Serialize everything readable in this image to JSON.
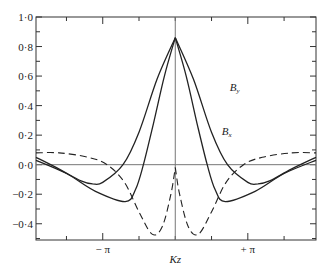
{
  "chart_data": {
    "type": "line",
    "title": "",
    "xlabel": "Kz",
    "ylabel": "",
    "xlim_in_pi": [
      -1.92,
      1.94
    ],
    "ylim": [
      -0.51,
      1.0
    ],
    "grid": false,
    "legend": "inline labels near curves",
    "y_ticks": [
      1.0,
      0.8,
      0.6,
      0.4,
      0.2,
      0.0,
      -0.2,
      -0.4
    ],
    "y_tick_labels": [
      "1·0",
      "0·8",
      "0·6",
      "0·4",
      "0·2",
      "0·0",
      "−0·2",
      "−0·4"
    ],
    "x_tick_labels": [
      {
        "at_pi": -1,
        "label": "− π"
      },
      {
        "at_pi": 1,
        "label": "+ π"
      }
    ],
    "horizontal_reference": 0.0,
    "vertical_reference_at_pi": 0.0,
    "series": [
      {
        "name": "By",
        "label_main": "B",
        "label_sub": "y",
        "style": "solid",
        "x_in_pi": [
          -1.92,
          -1.6,
          -1.3,
          -1.14,
          -1.0,
          -0.72,
          -0.5,
          -0.25,
          0.0,
          0.25,
          0.5,
          0.72,
          1.0,
          1.14,
          1.3,
          1.6,
          1.94
        ],
        "y": [
          0.05,
          -0.03,
          -0.11,
          -0.13,
          -0.12,
          0.0,
          0.22,
          0.58,
          0.86,
          0.58,
          0.22,
          0.0,
          -0.12,
          -0.13,
          -0.11,
          -0.03,
          0.05
        ]
      },
      {
        "name": "Bx",
        "label_main": "B",
        "label_sub": "x",
        "style": "solid",
        "x_in_pi": [
          -1.92,
          -1.5,
          -1.1,
          -0.69,
          -0.55,
          -0.44,
          -0.3,
          -0.15,
          0.0,
          0.15,
          0.3,
          0.44,
          0.55,
          0.69,
          1.1,
          1.5,
          1.94
        ],
        "y": [
          0.03,
          -0.06,
          -0.18,
          -0.25,
          -0.17,
          0.0,
          0.28,
          0.6,
          0.86,
          0.6,
          0.28,
          0.0,
          -0.17,
          -0.25,
          -0.18,
          -0.06,
          0.03
        ]
      },
      {
        "name": "dashed",
        "label_main": "",
        "label_sub": "",
        "style": "dashed",
        "x_in_pi": [
          -1.92,
          -1.6,
          -1.2,
          -0.94,
          -0.7,
          -0.5,
          -0.32,
          -0.18,
          -0.06,
          0.0,
          0.06,
          0.18,
          0.32,
          0.5,
          0.7,
          0.94,
          1.2,
          1.6,
          1.94
        ],
        "y": [
          0.08,
          0.08,
          0.05,
          0.0,
          -0.12,
          -0.32,
          -0.47,
          -0.42,
          -0.2,
          -0.02,
          -0.2,
          -0.42,
          -0.47,
          -0.32,
          -0.12,
          0.0,
          0.05,
          0.08,
          0.08
        ]
      }
    ],
    "label_positions": {
      "By": {
        "x_in_pi": 0.75,
        "y": 0.5
      },
      "Bx": {
        "x_in_pi": 0.64,
        "y": 0.2
      }
    }
  }
}
